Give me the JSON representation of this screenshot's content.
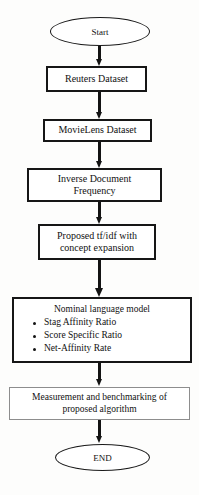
{
  "diagram": {
    "type": "flowchart",
    "background_color": "#fdfdfc",
    "stroke_color": "#161616",
    "nodes": [
      {
        "id": "start",
        "shape": "ellipse",
        "label": "Start"
      },
      {
        "id": "reuters",
        "shape": "process",
        "label": "Reuters Dataset"
      },
      {
        "id": "movielens",
        "shape": "process",
        "label": "MovieLens Dataset"
      },
      {
        "id": "idf",
        "shape": "process",
        "label": "Inverse Document\nFrequency"
      },
      {
        "id": "tfidf",
        "shape": "process",
        "label": "Proposed tf/idf with\nconcept expansion"
      },
      {
        "id": "nlm",
        "shape": "process",
        "label": "Nominal language model"
      },
      {
        "id": "measurement",
        "shape": "process",
        "label": "Measurement and benchmarking of\nproposed algorithm"
      },
      {
        "id": "end",
        "shape": "ellipse",
        "label": "END"
      }
    ],
    "nominal_language_model": {
      "heading": "Nominal language model",
      "bullets": [
        "Stag Affinity Ratio",
        "Score Specific Ratio",
        "Net-Affinity Rate"
      ]
    },
    "edges": [
      {
        "from": "start",
        "to": "reuters"
      },
      {
        "from": "reuters",
        "to": "movielens"
      },
      {
        "from": "movielens",
        "to": "idf"
      },
      {
        "from": "idf",
        "to": "tfidf"
      },
      {
        "from": "tfidf",
        "to": "nlm"
      },
      {
        "from": "nlm",
        "to": "measurement"
      },
      {
        "from": "measurement",
        "to": "end"
      }
    ]
  }
}
